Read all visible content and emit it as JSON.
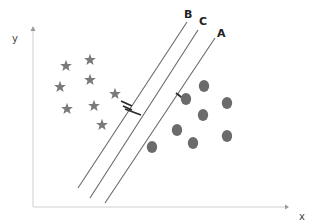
{
  "diagram": {
    "title": "",
    "type": "svm-hyperplanes",
    "axes": {
      "x_label": "x",
      "y_label": "y",
      "color": "#cfcfcf"
    },
    "hyperplanes": [
      {
        "label": "B",
        "x1": 78,
        "y1": 188,
        "x2": 187,
        "y2": 22,
        "label_x": 184,
        "label_y": 18
      },
      {
        "label": "C",
        "x1": 90,
        "y1": 198,
        "x2": 198,
        "y2": 30,
        "label_x": 199,
        "label_y": 25
      },
      {
        "label": "A",
        "x1": 105,
        "y1": 203,
        "x2": 215,
        "y2": 38,
        "label_x": 217,
        "label_y": 37
      }
    ],
    "line_color": "#6a6a6a",
    "class_stars": {
      "name": "stars",
      "color": "#7a7a7a",
      "points": [
        [
          66,
          66
        ],
        [
          90,
          60
        ],
        [
          60,
          87
        ],
        [
          90,
          80
        ],
        [
          67,
          109
        ],
        [
          94,
          106
        ],
        [
          102,
          125
        ],
        [
          115,
          94
        ]
      ]
    },
    "class_circles": {
      "name": "circles",
      "color": "#6b6b6b",
      "points": [
        [
          186,
          99
        ],
        [
          204,
          86
        ],
        [
          227,
          103
        ],
        [
          203,
          115
        ],
        [
          177,
          130
        ],
        [
          193,
          143
        ],
        [
          227,
          136
        ],
        [
          152,
          147
        ]
      ]
    },
    "margin_markers": [
      {
        "near": "B",
        "x1": 121,
        "y1": 101,
        "x2": 132,
        "y2": 106
      },
      {
        "near": "B",
        "x1": 123,
        "y1": 106,
        "x2": 132,
        "y2": 110
      },
      {
        "near": "C",
        "x1": 125,
        "y1": 109,
        "x2": 141,
        "y2": 115
      },
      {
        "near": "A",
        "x1": 176,
        "y1": 93,
        "x2": 185,
        "y2": 100
      }
    ]
  }
}
